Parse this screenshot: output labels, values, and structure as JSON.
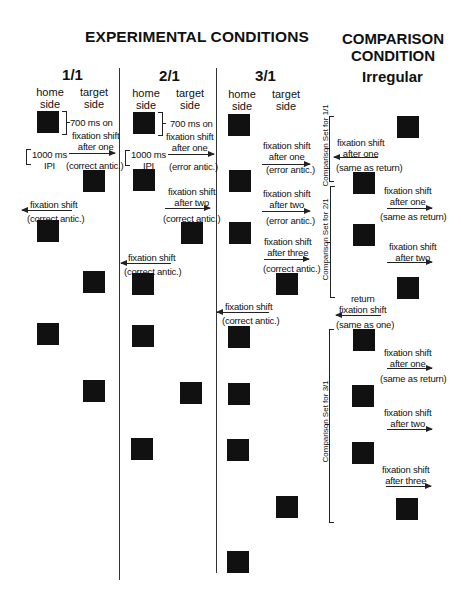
{
  "header": {
    "experimental_title": "EXPERIMENTAL CONDITIONS",
    "comparison_title_line1": "COMPARISON",
    "comparison_title_line2": "CONDITION"
  },
  "columns": [
    {
      "id": "1/1",
      "title": "1/1",
      "home": "home",
      "home2": "side",
      "target": "target",
      "target2": "side"
    },
    {
      "id": "2/1",
      "title": "2/1",
      "home": "home",
      "home2": "side",
      "target": "target",
      "target2": "side"
    },
    {
      "id": "3/1",
      "title": "3/1",
      "home": "home",
      "home2": "side",
      "target": "target",
      "target2": "side"
    },
    {
      "id": "irregular",
      "title": "Irregular"
    }
  ],
  "annotations": {
    "on_time": "700 ms on",
    "ipi_1": "1000 ms",
    "ipi_2": "IPI"
  },
  "labels": {
    "c1_a1": "fixation shift",
    "c1_a2": "after one",
    "c1_a3": "(correct antic.)",
    "c1_b1": "fixation shift",
    "c1_b2": "(correct antic.)",
    "c2_a1": "fixation shift",
    "c2_a2": "after one",
    "c2_a3": "(error antic.)",
    "c2_b1": "fixation shift",
    "c2_b2": "after two",
    "c2_b3": "(correct antic.)",
    "c2_c1": "fixation shift",
    "c2_c2": "(correct antic.)",
    "c3_a1": "fixation shift",
    "c3_a2": "after one",
    "c3_a3": "(error antic.)",
    "c3_b1": "fixation shift",
    "c3_b2": "after two",
    "c3_b3": "(error antic.)",
    "c3_c1": "fixation shift",
    "c3_c2": "after three",
    "c3_c3": "(correct antic.)",
    "c3_d1": "fixation shift",
    "c3_d2": "(correct antic.)",
    "ir_a1": "fixation shift",
    "ir_a2": "after one",
    "ir_a3": "(same as return)",
    "ir_b1": "fixation shift",
    "ir_b2": "after one",
    "ir_b3": "(same as return)",
    "ir_c1": "fixation shift",
    "ir_c2": "after two",
    "ir_d1": "return",
    "ir_d2": "fixation shift",
    "ir_d3": "(same as one)",
    "ir_e1": "fixation shift",
    "ir_e2": "after one",
    "ir_e3": "(same as return)",
    "ir_f1": "fixation shift",
    "ir_f2": "after two",
    "ir_g1": "fixation shift",
    "ir_g2": "after three"
  },
  "brackets": {
    "set_1_1": "Comparison Set for 1/1",
    "set_2_1": "Comparison Set for 2/1",
    "set_3_1": "Comparison Set for 3/1"
  },
  "colors": {
    "square": "#111111",
    "line": "#333333",
    "background": "#ffffff"
  }
}
